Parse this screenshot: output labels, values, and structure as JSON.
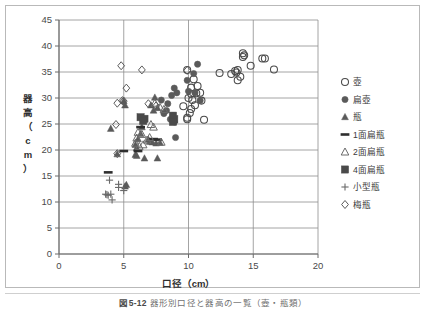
{
  "figure": {
    "caption_number": "図5-12",
    "caption_text": "器形別口径と器高の一覧（壺・瓶類）"
  },
  "chart_data": {
    "type": "scatter",
    "title": "",
    "xlabel": "口径（cm）",
    "ylabel": "器高（cm）",
    "ylabel_chars": [
      "器",
      "高",
      "（",
      "c",
      "m",
      "）"
    ],
    "xlim": [
      0,
      20
    ],
    "ylim": [
      0,
      45
    ],
    "xticks": [
      0,
      5,
      10,
      15,
      20
    ],
    "yticks": [
      0,
      5,
      10,
      15,
      20,
      25,
      30,
      35,
      40,
      45
    ],
    "xtick_labels": [
      "0",
      "5",
      "10",
      "15",
      "20"
    ],
    "ytick_labels": [
      "0",
      "5",
      "10",
      "15",
      "20",
      "25",
      "30",
      "35",
      "40",
      "45"
    ],
    "grid": "horizontal-and-vertical",
    "legend_position": "right",
    "series": [
      {
        "name": "壺",
        "marker": "open-circle",
        "color": "#4a4a4a",
        "points": [
          [
            9.9,
            35.4
          ],
          [
            10.4,
            33.6
          ],
          [
            10.2,
            32.0
          ],
          [
            10.2,
            30.8
          ],
          [
            10.6,
            30.9
          ],
          [
            10.0,
            30.0
          ],
          [
            10.3,
            29.6
          ],
          [
            10.5,
            28.6
          ],
          [
            10.2,
            27.9
          ],
          [
            10.1,
            27.1
          ],
          [
            9.9,
            26.2
          ],
          [
            9.9,
            25.9
          ],
          [
            10.7,
            32.3
          ],
          [
            11.0,
            29.5
          ],
          [
            11.2,
            25.8
          ],
          [
            12.4,
            34.8
          ],
          [
            13.3,
            34.6
          ],
          [
            13.6,
            35.2
          ],
          [
            13.7,
            34.9
          ],
          [
            13.8,
            35.4
          ],
          [
            13.8,
            33.4
          ],
          [
            14.0,
            34.1
          ],
          [
            14.2,
            38.6
          ],
          [
            14.3,
            38.2
          ],
          [
            14.2,
            37.9
          ],
          [
            14.8,
            36.2
          ],
          [
            15.7,
            37.6
          ],
          [
            15.9,
            37.6
          ],
          [
            16.6,
            35.5
          ],
          [
            9.6,
            28.4
          ],
          [
            10.9,
            31.0
          ]
        ]
      },
      {
        "name": "扁壺",
        "marker": "filled-circle",
        "color": "#5a5a5a",
        "points": [
          [
            10.7,
            36.5
          ],
          [
            10.4,
            34.7
          ],
          [
            9.9,
            33.4
          ],
          [
            8.9,
            31.9
          ],
          [
            9.1,
            31.0
          ],
          [
            10.0,
            31.3
          ],
          [
            10.5,
            31.0
          ],
          [
            10.9,
            29.5
          ],
          [
            8.7,
            30.5
          ],
          [
            8.4,
            28.9
          ],
          [
            8.3,
            27.6
          ],
          [
            8.8,
            26.6
          ],
          [
            8.9,
            25.4
          ],
          [
            9.0,
            22.4
          ],
          [
            7.9,
            29.6
          ],
          [
            8.1,
            27.0
          ],
          [
            8.6,
            25.9
          ]
        ]
      },
      {
        "name": "瓶",
        "marker": "filled-triangle",
        "color": "#5a5a5a",
        "points": [
          [
            7.4,
            30.1
          ],
          [
            7.1,
            28.6
          ],
          [
            5.0,
            29.4
          ],
          [
            5.1,
            28.6
          ],
          [
            7.3,
            27.6
          ],
          [
            7.6,
            28.1
          ],
          [
            4.0,
            24.1
          ],
          [
            6.4,
            24.4
          ],
          [
            6.3,
            23.1
          ],
          [
            6.1,
            22.1
          ],
          [
            5.9,
            21.0
          ],
          [
            6.0,
            20.4
          ],
          [
            7.2,
            21.5
          ],
          [
            7.5,
            21.3
          ],
          [
            7.8,
            21.4
          ],
          [
            5.9,
            19.1
          ],
          [
            6.0,
            18.9
          ],
          [
            6.6,
            18.4
          ],
          [
            7.6,
            18.4
          ],
          [
            4.5,
            19.2
          ],
          [
            5.1,
            13.0
          ],
          [
            5.2,
            13.3
          ],
          [
            6.9,
            22.0
          ],
          [
            7.0,
            21.6
          ]
        ]
      },
      {
        "name": "1面扁瓶",
        "marker": "dash",
        "color": "#2e2e2e",
        "points": [
          [
            6.5,
            26.0
          ],
          [
            6.3,
            24.4
          ],
          [
            7.3,
            22.1
          ],
          [
            7.6,
            22.0
          ],
          [
            5.0,
            19.8
          ],
          [
            3.8,
            15.7
          ],
          [
            6.1,
            19.8
          ]
        ]
      },
      {
        "name": "2面扁瓶",
        "marker": "open-triangle",
        "color": "#6a6a6a",
        "points": [
          [
            7.4,
            29.0
          ],
          [
            7.8,
            28.2
          ],
          [
            8.1,
            27.8
          ],
          [
            6.1,
            23.4
          ],
          [
            6.4,
            23.0
          ],
          [
            7.1,
            24.9
          ],
          [
            7.3,
            24.4
          ],
          [
            5.9,
            21.3
          ],
          [
            6.2,
            20.7
          ],
          [
            6.5,
            21.0
          ],
          [
            6.8,
            21.9
          ],
          [
            7.9,
            21.5
          ],
          [
            6.0,
            22.3
          ],
          [
            7.0,
            22.4
          ]
        ]
      },
      {
        "name": "4面扁瓶",
        "marker": "filled-square",
        "color": "#4a4a4a",
        "points": [
          [
            6.3,
            26.3
          ],
          [
            6.6,
            26.0
          ],
          [
            8.8,
            26.6
          ],
          [
            8.9,
            25.9
          ],
          [
            8.8,
            25.4
          ],
          [
            6.5,
            25.6
          ]
        ]
      },
      {
        "name": "小型瓶",
        "marker": "plus",
        "color": "#6a6a6a",
        "points": [
          [
            3.9,
            14.2
          ],
          [
            4.6,
            13.4
          ],
          [
            4.6,
            12.8
          ],
          [
            3.6,
            11.5
          ],
          [
            3.8,
            11.3
          ],
          [
            4.0,
            11.5
          ],
          [
            4.1,
            10.4
          ],
          [
            5.0,
            12.2
          ],
          [
            3.7,
            11.4
          ]
        ]
      },
      {
        "name": "梅瓶",
        "marker": "open-diamond",
        "color": "#5a5a5a",
        "points": [
          [
            4.8,
            36.2
          ],
          [
            6.4,
            35.4
          ],
          [
            5.2,
            31.9
          ],
          [
            4.5,
            29.0
          ],
          [
            4.9,
            29.5
          ],
          [
            5.0,
            29.4
          ],
          [
            4.4,
            24.9
          ],
          [
            4.5,
            19.3
          ],
          [
            6.9,
            28.9
          ],
          [
            7.5,
            28.5
          ],
          [
            9.9,
            35.3
          ]
        ]
      }
    ]
  },
  "legend": {
    "items": [
      {
        "label": "壺",
        "marker": "open-circle"
      },
      {
        "label": "扁壺",
        "marker": "filled-circle"
      },
      {
        "label": "瓶",
        "marker": "filled-triangle"
      },
      {
        "label": "1面扁瓶",
        "marker": "dash"
      },
      {
        "label": "2面扁瓶",
        "marker": "open-triangle"
      },
      {
        "label": "4面扁瓶",
        "marker": "filled-square"
      },
      {
        "label": "小型瓶",
        "marker": "plus"
      },
      {
        "label": "梅瓶",
        "marker": "open-diamond"
      }
    ]
  }
}
